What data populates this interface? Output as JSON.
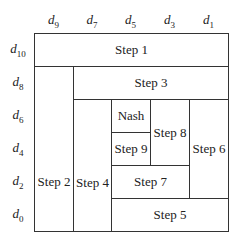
{
  "columns": [
    {
      "base": "d",
      "sub": "9"
    },
    {
      "base": "d",
      "sub": "7"
    },
    {
      "base": "d",
      "sub": "5"
    },
    {
      "base": "d",
      "sub": "3"
    },
    {
      "base": "d",
      "sub": "1"
    }
  ],
  "rows": [
    {
      "base": "d",
      "sub": "10"
    },
    {
      "base": "d",
      "sub": "8"
    },
    {
      "base": "d",
      "sub": "6"
    },
    {
      "base": "d",
      "sub": "4"
    },
    {
      "base": "d",
      "sub": "2"
    },
    {
      "base": "d",
      "sub": "0"
    }
  ],
  "cells": {
    "step1": "Step 1",
    "step2": "Step 2",
    "step3": "Step 3",
    "step4": "Step 4",
    "step5": "Step 5",
    "step6": "Step 6",
    "step7": "Step 7",
    "step8": "Step 8",
    "step9": "Step 9",
    "nash": "Nash"
  }
}
